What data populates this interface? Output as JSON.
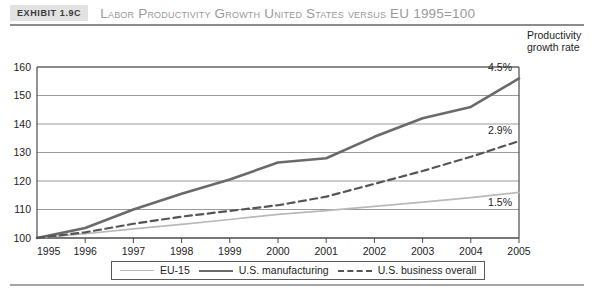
{
  "exhibit": {
    "tag": "Exhibit 1.9C",
    "title": "Labor Productivity Growth United States versus EU 1995=100"
  },
  "annotations": {
    "header_line1": "Productivity",
    "header_line2": "growth rate",
    "manufacturing_rate": "4.5%",
    "business_rate": "2.9%",
    "eu_rate": "1.5%"
  },
  "legend": {
    "items": [
      {
        "label": "EU-15",
        "style": "solid-light",
        "color": "#b9b9b9"
      },
      {
        "label": "U.S. manufacturing",
        "style": "solid-dark",
        "color": "#6a6a6a"
      },
      {
        "label": "U.S. business overall",
        "style": "dashed",
        "color": "#555555"
      }
    ]
  },
  "chart_data": {
    "type": "line",
    "title": "Labor Productivity Growth United States versus EU 1995=100",
    "xlabel": "",
    "ylabel": "",
    "xlim": [
      1995,
      2005
    ],
    "ylim": [
      100,
      160
    ],
    "yticks": [
      100,
      110,
      120,
      130,
      140,
      150,
      160
    ],
    "grid": true,
    "legend_position": "bottom",
    "x": [
      1995,
      1996,
      1997,
      1998,
      1999,
      2000,
      2001,
      2002,
      2003,
      2004,
      2005
    ],
    "categories": [
      "1995",
      "1996",
      "1997",
      "1998",
      "1999",
      "2000",
      "2001",
      "2002",
      "2003",
      "2004",
      "2005"
    ],
    "series": [
      {
        "name": "EU-15",
        "color": "#b9b9b9",
        "style": "solid",
        "width": 1.7,
        "end_label": "1.5%",
        "values": [
          100,
          101.5,
          103.2,
          104.8,
          106.5,
          108.3,
          109.6,
          111.1,
          112.6,
          114.2,
          116.0
        ]
      },
      {
        "name": "U.S. manufacturing",
        "color": "#6a6a6a",
        "style": "solid",
        "width": 2.6,
        "end_label": "4.5%",
        "values": [
          100,
          103.5,
          110.0,
          115.5,
          120.5,
          126.5,
          128.0,
          135.5,
          142.0,
          146.0,
          156.0
        ]
      },
      {
        "name": "U.S. business overall",
        "color": "#555555",
        "style": "dashed",
        "width": 2.2,
        "end_label": "2.9%",
        "values": [
          100,
          102.0,
          105.0,
          107.5,
          109.5,
          111.5,
          114.5,
          119.0,
          123.5,
          128.5,
          134.0
        ]
      }
    ]
  }
}
